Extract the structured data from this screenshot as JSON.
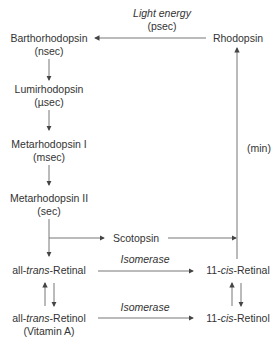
{
  "diagram": {
    "nodes": {
      "rhodopsin": "Rhodopsin",
      "barthorhodopsin": "Barthorhodopsin",
      "barthorhodopsin_time": "(nsec)",
      "lumirhodopsin": "Lumirhodopsin",
      "lumirhodopsin_time": "(µsec)",
      "metarhodopsin1": "Metarhodopsin I",
      "metarhodopsin1_time": "(msec)",
      "metarhodopsin2": "Metarhodopsin II",
      "metarhodopsin2_time": "(sec)",
      "scotopsin": "Scotopsin",
      "all_trans_retinal_prefix": "all-",
      "all_trans_retinal_italic": "trans",
      "all_trans_retinal_suffix": "-Retinal",
      "cis_retinal_prefix": "11-",
      "cis_retinal_italic": "cis",
      "cis_retinal_suffix": "-Retinal",
      "all_trans_retinol_prefix": "all-",
      "all_trans_retinol_italic": "trans",
      "all_trans_retinol_suffix": "-Retinol",
      "all_trans_retinol_note": "(Vitamin A)",
      "cis_retinol_prefix": "11-",
      "cis_retinol_italic": "cis",
      "cis_retinol_suffix": "-Retinol"
    },
    "edge_labels": {
      "light_energy": "Light energy",
      "light_time": "(psec)",
      "regeneration_time": "(min)",
      "isomerase_retinal": "Isomerase",
      "isomerase_retinol": "Isomerase"
    },
    "colors": {
      "line": "#555555",
      "text": "#333333"
    }
  }
}
